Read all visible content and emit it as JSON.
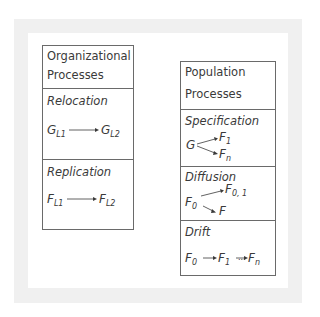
{
  "left_panel": {
    "header": [
      "Organizational",
      "Processes"
    ],
    "sections": [
      {
        "label": "Relocation",
        "from": {
          "base": "G",
          "sub": "L1"
        },
        "to": {
          "base": "G",
          "sub": "L2"
        }
      },
      {
        "label": "Replication",
        "from": {
          "base": "F",
          "sub": "L1"
        },
        "to": {
          "base": "F",
          "sub": "L2"
        }
      }
    ]
  },
  "right_panel": {
    "header": [
      "Population",
      "Processes"
    ],
    "sections": [
      {
        "label": "Specification",
        "source": "G",
        "targets": [
          {
            "base": "F",
            "sub": "1"
          },
          {
            "base": "F",
            "sub": "n"
          }
        ]
      },
      {
        "label": "Diffusion",
        "source": {
          "base": "F",
          "sub": "0"
        },
        "targets": [
          {
            "base": "F",
            "sub": "0, 1"
          },
          {
            "base": "F",
            "sub": ""
          }
        ]
      },
      {
        "label": "Drift",
        "chain": [
          {
            "base": "F",
            "sub": "0"
          },
          {
            "base": "F",
            "sub": "1"
          },
          {
            "base": "F",
            "sub": "n"
          }
        ],
        "ellipsis": "..."
      }
    ]
  },
  "colors": {
    "frame": "#f0f0f0",
    "border": "#6a6a6a",
    "text": "#3a3a3a"
  }
}
